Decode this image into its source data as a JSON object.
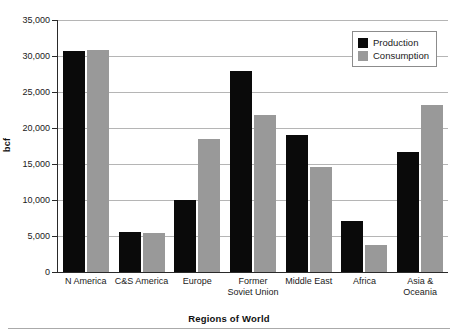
{
  "chart_data": {
    "type": "bar",
    "title": "",
    "xlabel": "Regions of World",
    "ylabel": "bcf",
    "categories": [
      "N America",
      "C&S America",
      "Europe",
      "Former\nSoviet Union",
      "Middle East",
      "Africa",
      "Asia &\nOceania"
    ],
    "series": [
      {
        "name": "Production",
        "color": "#0a0a0a",
        "values": [
          30700,
          5600,
          10000,
          27900,
          19000,
          7100,
          16700
        ]
      },
      {
        "name": "Consumption",
        "color": "#999999",
        "values": [
          30900,
          5400,
          18500,
          21800,
          14600,
          3800,
          23200
        ]
      }
    ],
    "ylim": [
      0,
      35000
    ],
    "ytick_values": [
      0,
      5000,
      10000,
      15000,
      20000,
      25000,
      30000,
      35000
    ],
    "ytick_labels": [
      "0",
      "5,000",
      "10,000",
      "15,000",
      "20,000",
      "25,000",
      "30,000",
      "35,000"
    ],
    "grid": true,
    "legend_position": "top-right"
  },
  "legend": {
    "items": [
      {
        "label": "Production"
      },
      {
        "label": "Consumption"
      }
    ]
  }
}
